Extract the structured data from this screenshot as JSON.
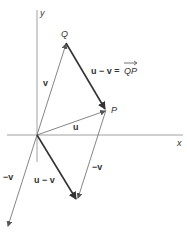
{
  "diagram": {
    "axes": {
      "x_label": "x",
      "y_label": "y"
    },
    "points": {
      "origin": {
        "x": 37,
        "y": 135
      },
      "Q": {
        "label": "Q",
        "x": 66,
        "y": 43
      },
      "P": {
        "label": "P",
        "x": 106,
        "y": 110
      },
      "uv_end": {
        "x": 77,
        "y": 200
      },
      "neg_v_end": {
        "x": 8,
        "y": 227
      }
    },
    "labels": {
      "v": "v",
      "u": "u",
      "u_minus_v_QP": "u − v = ",
      "QP": "QP",
      "u_minus_v": "u − v",
      "neg_v_left": "−v",
      "neg_v_right": "−v"
    },
    "colors": {
      "axis": "#888888",
      "thin_vector": "#666666",
      "bold_vector": "#333333",
      "text": "#333333"
    }
  }
}
